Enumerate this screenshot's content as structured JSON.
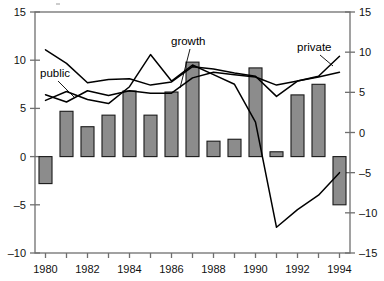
{
  "chart_data": {
    "type": "bar",
    "title": "",
    "subtitle": "",
    "xlabel": "",
    "ylabel": "",
    "grid": false,
    "legend_position": "inline-annotations",
    "x": [
      1980,
      1981,
      1982,
      1983,
      1984,
      1985,
      1986,
      1987,
      1988,
      1989,
      1990,
      1991,
      1992,
      1993,
      1994
    ],
    "categories": [
      "1980",
      "1981",
      "1982",
      "1983",
      "1984",
      "1985",
      "1986",
      "1987",
      "1988",
      "1989",
      "1990",
      "1991",
      "1992",
      "1993",
      "1994"
    ],
    "xtick_labels_shown": [
      "1980",
      "1982",
      "1984",
      "1986",
      "1988",
      "1990",
      "1992",
      "1994"
    ],
    "xlim": [
      1979.5,
      1994.5
    ],
    "left_axis": {
      "label": "",
      "ylim": [
        -10,
        15
      ],
      "ticks": [
        -10,
        -5,
        0,
        5,
        10,
        15
      ],
      "tick_labels": [
        "–10",
        "–5",
        "0",
        "5",
        "10",
        "15"
      ]
    },
    "right_axis": {
      "label": "",
      "ylim": [
        -15,
        15
      ],
      "ticks": [
        -15,
        -10,
        -5,
        0,
        5,
        10,
        15
      ],
      "tick_labels": [
        "–15",
        "–10",
        "–5",
        "0",
        "5",
        "10",
        "15"
      ]
    },
    "series": [
      {
        "name": "bars",
        "label": "",
        "type": "bar",
        "axis": "left",
        "color": "#8c8c8c",
        "edge_color": "#1a1a1a",
        "values": [
          -2.8,
          4.7,
          3.1,
          4.3,
          6.8,
          4.3,
          6.7,
          9.8,
          1.6,
          1.8,
          9.2,
          0.5,
          6.4,
          7.5,
          -5.0
        ]
      },
      {
        "name": "public",
        "label": "public",
        "type": "line",
        "axis": "right",
        "color": "#000000",
        "values": [
          4.7,
          3.8,
          5.2,
          4.6,
          5.2,
          4.9,
          4.9,
          6.8,
          7.5,
          7.2,
          6.9,
          5.9,
          6.4,
          6.9,
          7.5
        ]
      },
      {
        "name": "private",
        "label": "private",
        "type": "line",
        "axis": "right",
        "color": "#000000",
        "values": [
          10.3,
          8.6,
          6.2,
          6.6,
          6.7,
          5.9,
          6.3,
          8.2,
          7.9,
          7.4,
          7.0,
          4.5,
          6.4,
          7.0,
          9.5
        ]
      },
      {
        "name": "growth",
        "label": "growth",
        "type": "line",
        "axis": "right",
        "color": "#000000",
        "values": [
          4.0,
          5.1,
          4.1,
          3.6,
          5.7,
          9.7,
          6.4,
          8.4,
          7.2,
          6.0,
          1.3,
          -11.8,
          -9.6,
          -7.8,
          -5.0
        ]
      }
    ],
    "annotations": [
      {
        "name": "public-label",
        "text": "public",
        "x_px": 40,
        "y_px": 77
      },
      {
        "name": "growth-label",
        "text": "growth",
        "x_px": 171,
        "y_px": 45
      },
      {
        "name": "private-label",
        "text": "private",
        "x_px": 297,
        "y_px": 51
      }
    ]
  }
}
